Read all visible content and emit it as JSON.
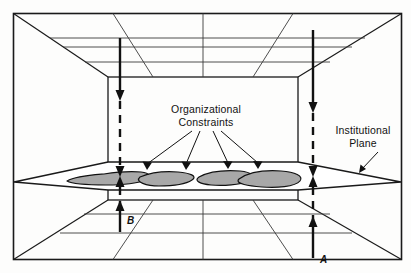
{
  "figure": {
    "title_visible": false,
    "background_color": "#fdfdfc",
    "frame_color": "#1a1a1a",
    "line_color": "#1a1a1a",
    "blob_fill_color": "#a8a8a8",
    "blob_stroke_color": "#111111"
  },
  "labels": {
    "organizational_constraints_line1": "Organizational",
    "organizational_constraints_line2": "Constraints",
    "institutional_plane_line1": "Institutional",
    "institutional_plane_line2": "Plane",
    "axis_b": "B",
    "axis_a": "A"
  },
  "diagram_data": {
    "type": "perspective-box-diagram",
    "description_visible_elements": [
      "outer rectangular frame",
      "one-point perspective room (ceiling grid, floor grid, side walls)",
      "horizontal institutional plane through the middle",
      "four shaded irregular blobs on the plane",
      "two vertical arrow lines labeled A and B piercing the plane",
      "leader lines from Organizational Constraints to the blobs",
      "leader arrow from Institutional Plane to the plane edge"
    ],
    "vertical_arrows": [
      {
        "id": "B",
        "x": 120,
        "direction": "downward",
        "label": "B",
        "label_x": 127,
        "label_y": 222
      },
      {
        "id": "A",
        "x": 313,
        "direction": "upward",
        "label": "A",
        "label_x": 320,
        "label_y": 262
      }
    ],
    "blob_count": 4,
    "plane_y_center": 176
  }
}
